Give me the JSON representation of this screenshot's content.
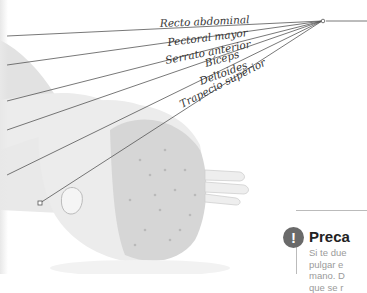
{
  "illustration": {
    "subject": "head-neck-anatomical-drawing",
    "pointer_origin": {
      "x": 322,
      "y": 21
    },
    "labels": [
      {
        "text": "Recto abdominal",
        "x": 160,
        "y": 27,
        "angle": -2.5
      },
      {
        "text": "Pectoral mayor",
        "x": 168,
        "y": 46,
        "angle": -7
      },
      {
        "text": "Serrato anterior",
        "x": 166,
        "y": 64,
        "angle": -11
      },
      {
        "text": "Bíceps",
        "x": 206,
        "y": 67,
        "angle": -16
      },
      {
        "text": "Deltoides",
        "x": 201,
        "y": 85,
        "angle": -20
      },
      {
        "text": "Trapecio superior",
        "x": 182,
        "y": 108,
        "angle": -27
      }
    ]
  },
  "callout": {
    "icon": "exclamation-icon",
    "title": "Preca",
    "lines": [
      "Si te due",
      "pulgar e",
      "mano. D",
      "que se r"
    ]
  }
}
